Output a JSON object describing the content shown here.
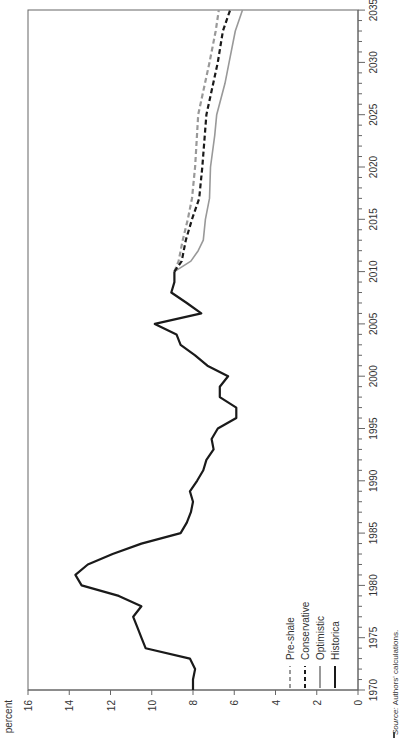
{
  "chart_data": {
    "type": "line",
    "orientation": "rotated-90-ccw",
    "title": "",
    "ylabel": "percent",
    "xlabel": "",
    "ylim": [
      0,
      16
    ],
    "xlim": [
      1970,
      2035
    ],
    "yticks": [
      0,
      2,
      4,
      6,
      8,
      10,
      12,
      14,
      16
    ],
    "xticks": [
      1970,
      1975,
      1980,
      1985,
      1990,
      1995,
      2000,
      2005,
      2010,
      2015,
      2020,
      2025,
      2030,
      2035
    ],
    "grid": false,
    "legend_position": "lower-left inside plot",
    "series": [
      {
        "name": "Pre-shale",
        "style": "dashed",
        "color": "#999999",
        "x": [
          2010,
          2011,
          2013,
          2015,
          2017,
          2020,
          2025,
          2030,
          2033,
          2035
        ],
        "values": [
          8.9,
          8.7,
          8.5,
          8.25,
          8.05,
          7.9,
          7.75,
          7.2,
          6.9,
          6.75
        ]
      },
      {
        "name": "Conservative",
        "style": "dashed",
        "color": "#1a1a1a",
        "x": [
          2010,
          2011,
          2013,
          2015,
          2017,
          2020,
          2025,
          2030,
          2033,
          2035
        ],
        "values": [
          8.9,
          8.55,
          8.35,
          8.05,
          7.7,
          7.55,
          7.35,
          6.8,
          6.55,
          6.2
        ]
      },
      {
        "name": "Optimistic",
        "style": "solid",
        "color": "#999999",
        "x": [
          2010,
          2011,
          2012,
          2013,
          2015,
          2017,
          2020,
          2023,
          2025,
          2028,
          2030,
          2033,
          2035
        ],
        "values": [
          8.9,
          8.1,
          7.75,
          7.5,
          7.4,
          7.2,
          7.15,
          6.95,
          6.85,
          6.45,
          6.25,
          5.95,
          5.6
        ]
      },
      {
        "name": "Historica",
        "style": "solid",
        "color": "#1a1a1a",
        "x": [
          1970,
          1971,
          1972,
          1973,
          1974,
          1975,
          1976,
          1977,
          1978,
          1979,
          1980,
          1981,
          1982,
          1983,
          1984,
          1985,
          1986,
          1987,
          1988,
          1989,
          1990,
          1991,
          1992,
          1993,
          1994,
          1995,
          1996,
          1997,
          1998,
          1999,
          2000,
          2001,
          2002,
          2003,
          2004,
          2005,
          2006,
          2007,
          2008,
          2009,
          2010
        ],
        "values": [
          8.0,
          8.0,
          7.9,
          8.15,
          10.3,
          10.5,
          10.7,
          10.9,
          10.5,
          11.6,
          13.4,
          13.7,
          13.1,
          11.9,
          10.5,
          8.6,
          8.3,
          8.1,
          8.0,
          8.15,
          7.8,
          7.5,
          7.35,
          7.0,
          7.1,
          6.8,
          5.9,
          5.9,
          6.7,
          6.7,
          6.3,
          7.3,
          7.9,
          8.6,
          8.8,
          9.85,
          7.6,
          8.3,
          9.05,
          8.9,
          8.9
        ]
      }
    ],
    "source_note": "Source: Authors' calculations."
  },
  "axis": {
    "ylabel": "percent",
    "yticks": [
      "0",
      "2",
      "4",
      "6",
      "8",
      "10",
      "12",
      "14",
      "16"
    ],
    "xticks": [
      "1970",
      "1975",
      "1980",
      "1985",
      "1990",
      "1995",
      "2000",
      "2005",
      "2010",
      "2015",
      "2020",
      "2025",
      "2030",
      "2035"
    ]
  },
  "legend": [
    {
      "label": "Pre-shale",
      "style": "dashed",
      "color": "#999999"
    },
    {
      "label": "Conservative",
      "style": "dashed",
      "color": "#1a1a1a"
    },
    {
      "label": "Optimistic",
      "style": "solid",
      "color": "#999999"
    },
    {
      "label": "Historica",
      "style": "solid",
      "color": "#1a1a1a"
    }
  ],
  "source": {
    "prefix": "Source:",
    "text": "Authors' calculations."
  }
}
